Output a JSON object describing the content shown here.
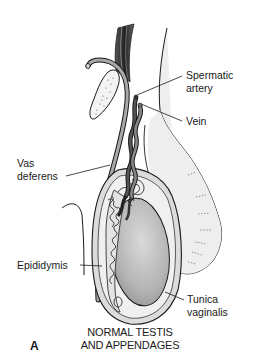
{
  "figure": {
    "panel_letter": "A",
    "caption_line1": "NORMAL TESTIS",
    "caption_line2": "AND APPENDAGES"
  },
  "labels": {
    "spermatic_artery_1": "Spermatic",
    "spermatic_artery_2": "artery",
    "vein": "Vein",
    "vas_deferens_1": "Vas",
    "vas_deferens_2": "deferens",
    "epididymis": "Epididymis",
    "tunica_vaginalis_1": "Tunica",
    "tunica_vaginalis_2": "vaginalis"
  },
  "colors": {
    "outline": "#1a1a1a",
    "testis_fill": "#bdbdbd",
    "scrotum_fill": "#eeeeee",
    "vessel_dark": "#333333",
    "tunica_fill": "#d9d9d9"
  }
}
